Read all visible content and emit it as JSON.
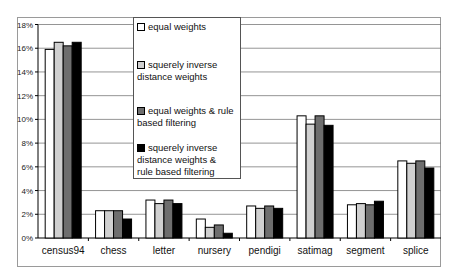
{
  "chart_data": {
    "type": "bar",
    "title": "",
    "xlabel": "",
    "ylabel": "",
    "ylim": [
      0,
      18
    ],
    "yticks": [
      "0%",
      "2%",
      "4%",
      "6%",
      "8%",
      "10%",
      "12%",
      "14%",
      "16%",
      "18%"
    ],
    "grid": true,
    "legend_position": "upper-left-inside",
    "categories": [
      "census94",
      "chess",
      "letter",
      "nursery",
      "pendigi",
      "satimag",
      "segment",
      "splice"
    ],
    "series": [
      {
        "name": "equal weights",
        "color": "#ffffff",
        "values": [
          15.9,
          2.3,
          3.2,
          1.6,
          2.7,
          10.3,
          2.8,
          6.5
        ]
      },
      {
        "name": "squerely inverse distance weights",
        "color": "#d0d0d0",
        "values": [
          16.5,
          2.3,
          2.9,
          0.9,
          2.5,
          9.6,
          2.9,
          6.3
        ]
      },
      {
        "name": "equal weights & rule based filtering",
        "color": "#6e6e6e",
        "values": [
          16.2,
          2.3,
          3.2,
          1.1,
          2.7,
          10.3,
          2.8,
          6.5
        ]
      },
      {
        "name": "squerely inverse distance weights & rule based filtering",
        "color": "#000000",
        "values": [
          16.5,
          1.6,
          2.9,
          0.4,
          2.5,
          9.5,
          3.1,
          5.9
        ]
      }
    ]
  },
  "legend": {
    "items": [
      {
        "lines": [
          "equal weights"
        ]
      },
      {
        "lines": [
          "squerely inverse",
          "distance weights"
        ]
      },
      {
        "lines": [
          "equal weights & rule",
          "based filtering"
        ]
      },
      {
        "lines": [
          "squerely inverse",
          "distance weights &",
          "rule based filtering"
        ]
      }
    ]
  }
}
